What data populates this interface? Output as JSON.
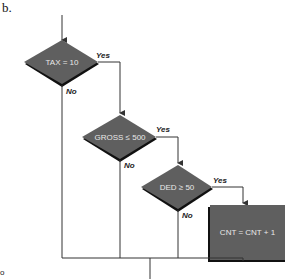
{
  "figure": {
    "part_label": "b.",
    "colors": {
      "node_fill": "#5f5f5f",
      "node_shadow": "#111111",
      "line": "#333333",
      "node_text": "#e8e8e8"
    },
    "nodes": [
      {
        "id": "d1",
        "type": "decision",
        "text": "TAX = 10"
      },
      {
        "id": "d2",
        "type": "decision",
        "text": "GROSS ≤ 500"
      },
      {
        "id": "d3",
        "type": "decision",
        "text": "DED ≥ 50"
      },
      {
        "id": "p1",
        "type": "process",
        "text": "CNT = CNT + 1"
      }
    ],
    "edge_labels": {
      "d1_yes": "Yes",
      "d1_no": "No",
      "d2_yes": "Yes",
      "d2_no": "No",
      "d3_yes": "Yes",
      "d3_no": "No"
    },
    "side_mark": "o"
  }
}
